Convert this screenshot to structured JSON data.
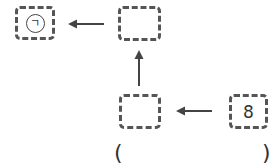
{
  "diagram": {
    "boxes": [
      {
        "id": "top-left",
        "label": "ㄱ",
        "circled": true
      },
      {
        "id": "top-middle",
        "label": ""
      },
      {
        "id": "bottom-middle",
        "label": ""
      },
      {
        "id": "bottom-right",
        "label": "8"
      }
    ],
    "arrows": [
      {
        "from": "bottom-right",
        "to": "bottom-middle",
        "direction": "left"
      },
      {
        "from": "bottom-middle",
        "to": "top-middle",
        "direction": "up"
      },
      {
        "from": "top-middle",
        "to": "top-left",
        "direction": "left"
      }
    ],
    "answer": {
      "open": "(",
      "close": ")",
      "value": ""
    }
  }
}
